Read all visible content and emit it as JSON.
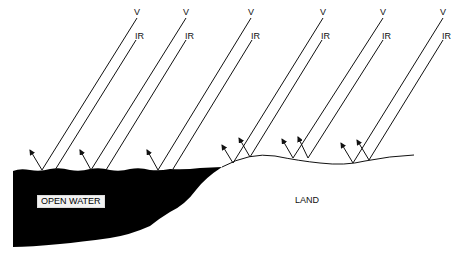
{
  "diagram": {
    "labels": {
      "visible": "V",
      "infrared": "IR",
      "water": "OPEN WATER",
      "land": "LAND"
    },
    "colors": {
      "water_fill": "#000000",
      "line": "#111111",
      "background": "#ffffff"
    },
    "ray_pairs": [
      {
        "v_top": [
          137,
          18
        ],
        "v_bottom": [
          42,
          170
        ],
        "ir_top": [
          136,
          40
        ],
        "ir_bottom": [
          55,
          170
        ],
        "reflect_to": [
          [
            30,
            150
          ]
        ]
      },
      {
        "v_top": [
          186,
          18
        ],
        "v_bottom": [
          91,
          170
        ],
        "ir_top": [
          186,
          40
        ],
        "ir_bottom": [
          106,
          170
        ],
        "reflect_to": [
          [
            80,
            150
          ]
        ]
      },
      {
        "v_top": [
          251,
          18
        ],
        "v_bottom": [
          158,
          170
        ],
        "ir_top": [
          252,
          40
        ],
        "ir_bottom": [
          173,
          169
        ],
        "reflect_to": [
          [
            147,
            150
          ]
        ]
      },
      {
        "v_top": [
          323,
          18
        ],
        "v_bottom": [
          233,
          163
        ],
        "ir_top": [
          322,
          40
        ],
        "ir_bottom": [
          250,
          157
        ],
        "reflect_to": [
          [
            222,
            145
          ],
          [
            239,
            138
          ]
        ]
      },
      {
        "v_top": [
          383,
          18
        ],
        "v_bottom": [
          293,
          158
        ],
        "ir_top": [
          383,
          40
        ],
        "ir_bottom": [
          308,
          158
        ],
        "reflect_to": [
          [
            282,
            139
          ],
          [
            298,
            137
          ]
        ]
      },
      {
        "v_top": [
          443,
          18
        ],
        "v_bottom": [
          353,
          163
        ],
        "ir_top": [
          443,
          40
        ],
        "ir_bottom": [
          369,
          160
        ],
        "reflect_to": [
          [
            341,
            143
          ],
          [
            357,
            140
          ]
        ]
      }
    ]
  }
}
